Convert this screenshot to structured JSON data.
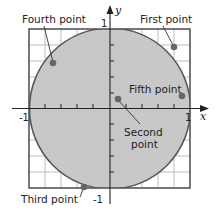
{
  "diagram": {
    "type": "unit-circle-on-grid",
    "axes": {
      "x_label": "x",
      "y_label": "y",
      "ticks": {
        "x_min": "-1",
        "x_max": "1",
        "y_max": "1",
        "y_min": "-1"
      }
    },
    "grid": {
      "cells": 10,
      "range": [
        -1,
        1
      ]
    },
    "circle": {
      "center": [
        0,
        0
      ],
      "radius": 1,
      "fill": "#c8c8c8",
      "stroke": "#555555"
    },
    "colors": {
      "grid": "#bbbbbb",
      "frame": "#555555",
      "point": "#666666",
      "axis": "#222222"
    },
    "points": [
      {
        "name": "First point",
        "label": "First point",
        "x": 0.8,
        "y": 0.77
      },
      {
        "name": "Second point",
        "label_line1": "Second",
        "label_line2": "point",
        "x": 0.09,
        "y": 0.11
      },
      {
        "name": "Third point",
        "label": "Third point",
        "x": -0.33,
        "y": -0.98
      },
      {
        "name": "Fourth point",
        "label": "Fourth point",
        "x": -0.71,
        "y": 0.56
      },
      {
        "name": "Fifth point",
        "label": "Fifth point",
        "x": 0.9,
        "y": 0.15
      }
    ]
  }
}
